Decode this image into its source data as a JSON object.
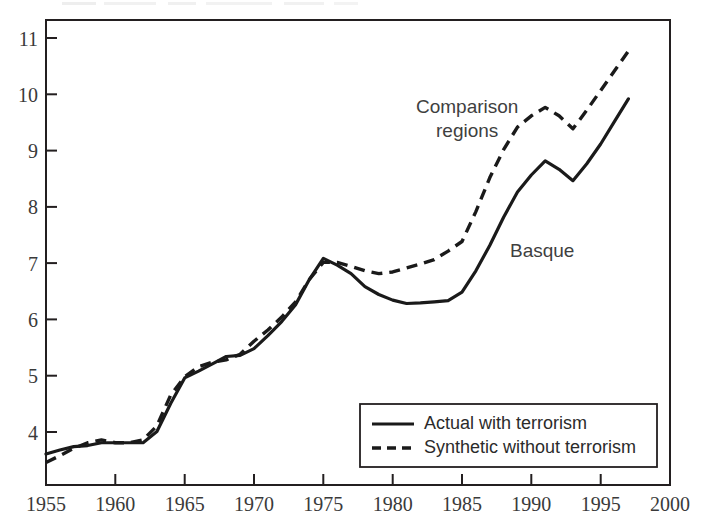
{
  "chart_data": {
    "type": "line",
    "title": "",
    "subtitle": "",
    "xlabel": "",
    "ylabel": "",
    "xlim": [
      1955,
      2000
    ],
    "ylim": [
      3.3,
      11.55
    ],
    "grid": false,
    "legend_position": "bottom-right",
    "x_ticks": [
      1955,
      1960,
      1965,
      1970,
      1975,
      1980,
      1985,
      1990,
      1995,
      2000
    ],
    "y_ticks": [
      4,
      5,
      6,
      7,
      8,
      9,
      10,
      11
    ],
    "x": [
      1955,
      1956,
      1957,
      1958,
      1959,
      1960,
      1961,
      1962,
      1963,
      1964,
      1965,
      1966,
      1967,
      1968,
      1969,
      1970,
      1971,
      1972,
      1973,
      1974,
      1975,
      1976,
      1977,
      1978,
      1979,
      1980,
      1981,
      1982,
      1983,
      1984,
      1985,
      1986,
      1987,
      1988,
      1989,
      1990,
      1991,
      1992,
      1993,
      1994,
      1995,
      1996,
      1997
    ],
    "series": [
      {
        "name": "Actual with terrorism",
        "style": "solid",
        "annotation": "Basque",
        "values": [
          3.85,
          3.92,
          3.98,
          4.0,
          4.05,
          4.05,
          4.05,
          4.05,
          4.25,
          4.75,
          5.2,
          5.32,
          5.45,
          5.58,
          5.6,
          5.72,
          5.95,
          6.2,
          6.5,
          6.95,
          7.32,
          7.2,
          7.05,
          6.82,
          6.68,
          6.58,
          6.52,
          6.53,
          6.55,
          6.57,
          6.72,
          7.1,
          7.55,
          8.05,
          8.5,
          8.8,
          9.05,
          8.9,
          8.7,
          9.0,
          9.35,
          9.75,
          10.15
        ]
      },
      {
        "name": "Synthetic without terrorism",
        "style": "dashed",
        "annotation": "Comparison regions",
        "values": [
          3.7,
          3.82,
          3.95,
          4.05,
          4.1,
          4.05,
          4.05,
          4.1,
          4.35,
          4.9,
          5.22,
          5.4,
          5.48,
          5.52,
          5.62,
          5.85,
          6.05,
          6.28,
          6.55,
          6.95,
          7.25,
          7.25,
          7.18,
          7.1,
          7.05,
          7.08,
          7.15,
          7.22,
          7.3,
          7.45,
          7.62,
          8.15,
          8.75,
          9.25,
          9.65,
          9.85,
          10.0,
          9.85,
          9.62,
          9.95,
          10.3,
          10.65,
          11.0
        ]
      }
    ],
    "annotations": [
      {
        "text": "Comparison",
        "x": 1984.1,
        "y": 10.0,
        "name": "comparison-regions-annotation-line1"
      },
      {
        "text": "regions",
        "x": 1985.5,
        "y": 9.5,
        "name": "comparison-regions-annotation-line2"
      },
      {
        "text": "Basque",
        "x": 1988.8,
        "y": 7.6,
        "name": "basque-annotation"
      }
    ]
  },
  "legend": {
    "items": [
      {
        "label": "Actual with terrorism",
        "style": "solid"
      },
      {
        "label": "Synthetic without terrorism",
        "style": "dashed"
      }
    ]
  },
  "colors": {
    "line": "#1a1a1a",
    "frame": "#231f20",
    "tick_text": "#3a3a3a",
    "annotation_text": "#3f3f3f",
    "background": "#ffffff"
  }
}
